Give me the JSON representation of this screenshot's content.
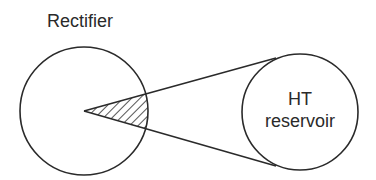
{
  "diagram": {
    "title_label": "Rectifier",
    "reservoir": {
      "line1": "HT",
      "line2": "reservoir"
    },
    "colors": {
      "stroke": "#2a2a2a",
      "background": "#ffffff"
    },
    "shapes": {
      "rectifier_circle": {
        "cx": 84,
        "cy": 111,
        "r": 64
      },
      "reservoir_circle": {
        "cx": 300,
        "cy": 112,
        "r": 58
      },
      "apex": {
        "x": 84,
        "y": 111
      },
      "upper_tangent_end": {
        "x": 275,
        "y": 58
      },
      "lower_tangent_end": {
        "x": 275,
        "y": 166
      },
      "hatched_sector": "conduction angle wedge inside rectifier circle"
    }
  }
}
